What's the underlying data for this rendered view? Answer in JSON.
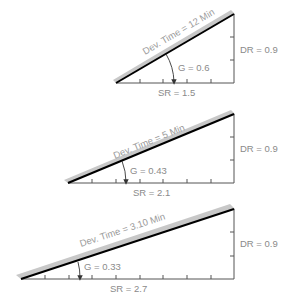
{
  "diagram": {
    "type": "slope-triangles",
    "colors": {
      "line": "#000000",
      "shade": "#c8c8c8",
      "axis": "#555555",
      "text": "#8a8a8a"
    },
    "panels": [
      {
        "dev_time": "Dev. Time = 12 Min",
        "gradient": "G = 0.6",
        "sr": "SR = 1.5",
        "dr": "DR = 0.9"
      },
      {
        "dev_time": "Dev. Time = 5 Min",
        "gradient": "G = 0.43",
        "sr": "SR = 2.1",
        "dr": "DR = 0.9"
      },
      {
        "dev_time": "Dev. Time = 3.10 Min",
        "gradient": "G = 0.33",
        "sr": "SR = 2.7",
        "dr": "DR = 0.9"
      }
    ]
  }
}
